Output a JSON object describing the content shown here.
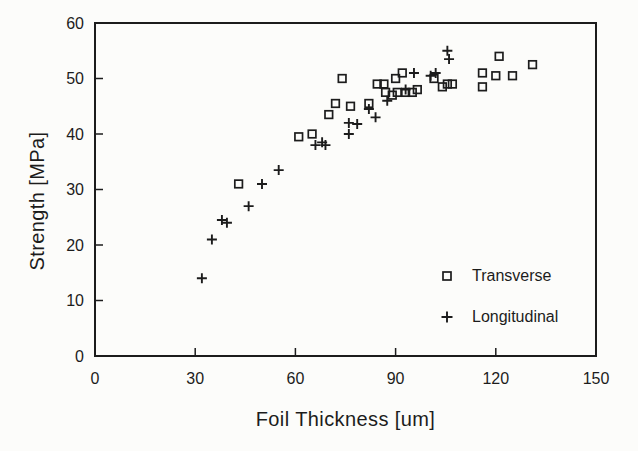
{
  "figure": {
    "background": "#fcfcfa",
    "ink": "#1c1c1c"
  },
  "chart_data": {
    "type": "scatter",
    "title": "",
    "xlabel": "Foil Thickness [um]",
    "ylabel": "Strength [MPa]",
    "xlim": [
      0,
      150
    ],
    "ylim": [
      0,
      60
    ],
    "x_ticks": [
      0,
      30,
      60,
      90,
      120,
      150
    ],
    "y_ticks": [
      0,
      10,
      20,
      30,
      40,
      50,
      60
    ],
    "grid": false,
    "frame": "full-box",
    "legend_position": "inside-bottom-right",
    "series": [
      {
        "name": "Transverse",
        "marker": "square",
        "points": [
          [
            43,
            31
          ],
          [
            61,
            39.5
          ],
          [
            65,
            40
          ],
          [
            70,
            43.5
          ],
          [
            72,
            45.5
          ],
          [
            74,
            50
          ],
          [
            76.5,
            45
          ],
          [
            82,
            45.5
          ],
          [
            84.5,
            49
          ],
          [
            86.5,
            49
          ],
          [
            87,
            47.5
          ],
          [
            89,
            47
          ],
          [
            90.5,
            47.5
          ],
          [
            93,
            47.5
          ],
          [
            95,
            47.5
          ],
          [
            96.5,
            48
          ],
          [
            90,
            50
          ],
          [
            92,
            51
          ],
          [
            101.5,
            50
          ],
          [
            104,
            48.5
          ],
          [
            105.5,
            49
          ],
          [
            107,
            49
          ],
          [
            116,
            48.5
          ],
          [
            116,
            51
          ],
          [
            120,
            50.5
          ],
          [
            121,
            54
          ],
          [
            125,
            50.5
          ],
          [
            131,
            52.5
          ]
        ]
      },
      {
        "name": "Longitudinal",
        "marker": "plus",
        "points": [
          [
            32,
            14
          ],
          [
            35,
            21
          ],
          [
            38,
            24.5
          ],
          [
            39.5,
            24
          ],
          [
            46,
            27
          ],
          [
            50,
            31
          ],
          [
            55,
            33.5
          ],
          [
            66,
            38
          ],
          [
            68,
            38.5
          ],
          [
            69,
            38
          ],
          [
            76,
            40
          ],
          [
            76,
            42
          ],
          [
            78.5,
            41.8
          ],
          [
            82,
            44.5
          ],
          [
            84,
            43
          ],
          [
            87.5,
            46
          ],
          [
            93,
            48
          ],
          [
            95.5,
            51
          ],
          [
            100.5,
            50.5
          ],
          [
            102,
            51
          ],
          [
            105.5,
            55
          ],
          [
            106,
            53.5
          ]
        ]
      }
    ]
  }
}
